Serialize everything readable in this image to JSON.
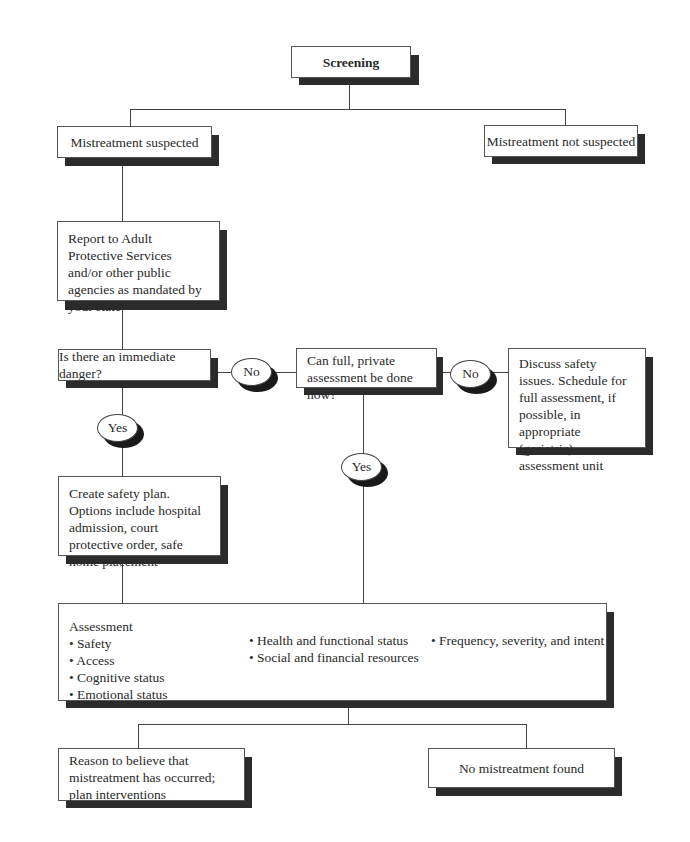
{
  "nodes": {
    "screening": "Screening",
    "suspected": "Mistreatment suspected",
    "not_suspected": "Mistreatment not suspected",
    "report": "Report to Adult Protective Services and/or other public agencies as mandated by your state",
    "immediate_danger": "Is there an immediate danger?",
    "full_assessment": "Can full, private assessment be done now?",
    "discuss": "Discuss safety issues. Schedule for full assessment, if possible, in appropriate (geriatric) assessment unit",
    "safety_plan": "Create safety plan.  Options include hospital admission, court protective order, safe home placement",
    "assessment": {
      "title": "Assessment",
      "col1": [
        "Safety",
        "Access",
        "Cognitive status",
        "Emotional status"
      ],
      "col2": [
        "Health and functional status",
        "Social and financial resources"
      ],
      "col3": [
        "Frequency, severity, and intent"
      ]
    },
    "reason": "Reason to believe that mistreatment has occurred; plan interventions",
    "no_mistreatment": "No mistreatment found"
  },
  "edges": {
    "no_1": "No",
    "no_2": "No",
    "yes_1": "Yes",
    "yes_2": "Yes"
  }
}
